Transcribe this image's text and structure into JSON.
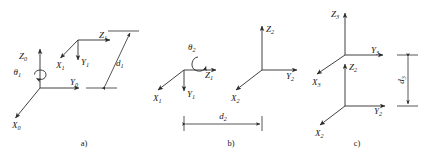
{
  "figure": {
    "background_color": "#ffffff",
    "stroke_color": "#2b2b2b",
    "text_color": "#1a1a1a"
  },
  "panels": [
    {
      "id": "a",
      "caption": "a)",
      "caption_x": 84,
      "caption_y": 146,
      "frames": [
        {
          "name": "frame-0",
          "origin": [
            40,
            88
          ],
          "axes": [
            {
              "axis": "Z",
              "label": "Z",
              "subscript": "0",
              "label_x": 27,
              "label_y": 59,
              "tip": [
                40,
                47
              ],
              "dir": "up"
            },
            {
              "axis": "Y",
              "label": "Y",
              "subscript": "0",
              "label_x": 70,
              "label_y": 85,
              "tip": [
                81,
                88
              ],
              "dir": "right"
            },
            {
              "axis": "X",
              "label": "X",
              "subscript": "0",
              "label_x": 12,
              "label_y": 128,
              "tip": [
                14,
                119
              ],
              "dir": "down-left"
            }
          ],
          "rotation": {
            "label": "θ",
            "subscript": "1",
            "label_x": 21,
            "label_y": 74,
            "about": "Z0"
          }
        },
        {
          "name": "frame-1",
          "origin": [
            78,
            40
          ],
          "axes": [
            {
              "axis": "Z",
              "label": "Z",
              "subscript": "1",
              "label_x": 100,
              "label_y": 38,
              "tip": [
                112,
                40
              ],
              "dir": "right"
            },
            {
              "axis": "Y",
              "label": "Y",
              "subscript": "1",
              "label_x": 82,
              "label_y": 64,
              "tip": [
                78,
                61
              ],
              "dir": "down"
            },
            {
              "axis": "X",
              "label": "X",
              "subscript": "1",
              "label_x": 56,
              "label_y": 67,
              "tip": [
                59,
                59
              ],
              "dir": "down-left"
            }
          ]
        }
      ],
      "dimension": {
        "name": "d1",
        "label": "d",
        "subscript": "1",
        "label_x": 116,
        "label_y": 64,
        "orientation": "slanted",
        "from": [
          104,
          88
        ],
        "to": [
          128,
          40
        ],
        "ext_top": {
          "from": [
            108,
            31
          ],
          "to": [
            138,
            31
          ]
        },
        "ext_bottom": {
          "from": [
            86,
            88
          ],
          "to": [
            116,
            88
          ]
        }
      }
    },
    {
      "id": "b",
      "caption": "b)",
      "caption_x": 231,
      "caption_y": 146,
      "frames": [
        {
          "name": "frame-1",
          "origin": [
            184,
            70
          ],
          "axes": [
            {
              "axis": "Z",
              "label": "Z",
              "subscript": "1",
              "label_x": 206,
              "label_y": 77,
              "tip": [
                218,
                70
              ],
              "dir": "right"
            },
            {
              "axis": "Y",
              "label": "Y",
              "subscript": "1",
              "label_x": 188,
              "label_y": 96,
              "tip": [
                184,
                92
              ],
              "dir": "down"
            },
            {
              "axis": "X",
              "label": "X",
              "subscript": "1",
              "label_x": 154,
              "label_y": 100,
              "tip": [
                157,
                91
              ],
              "dir": "down-left"
            }
          ],
          "rotation": {
            "label": "θ",
            "subscript": "2",
            "label_x": 191,
            "label_y": 49,
            "about": "Z1"
          }
        },
        {
          "name": "frame-2",
          "origin": [
            262,
            70
          ],
          "axes": [
            {
              "axis": "Z",
              "label": "Z",
              "subscript": "2",
              "label_x": 267,
              "label_y": 31,
              "tip": [
                262,
                24
              ],
              "dir": "up"
            },
            {
              "axis": "Y",
              "label": "Y",
              "subscript": "2",
              "label_x": 287,
              "label_y": 78,
              "tip": [
                299,
                70
              ],
              "dir": "right"
            },
            {
              "axis": "X",
              "label": "X",
              "subscript": "2",
              "label_x": 232,
              "label_y": 100,
              "tip": [
                235,
                91
              ],
              "dir": "down-left"
            }
          ]
        }
      ],
      "dimension": {
        "name": "d2",
        "label": "d",
        "subscript": "2",
        "label_x": 218,
        "label_y": 117,
        "orientation": "horizontal",
        "from": [
          184,
          124
        ],
        "to": [
          262,
          124
        ],
        "ext_left": {
          "from": [
            184,
            116
          ],
          "to": [
            184,
            132
          ]
        },
        "ext_right": {
          "from": [
            262,
            116
          ],
          "to": [
            262,
            132
          ]
        }
      }
    },
    {
      "id": "c",
      "caption": "c)",
      "caption_x": 357,
      "caption_y": 146,
      "frames": [
        {
          "name": "frame-2",
          "origin": [
            345,
            106
          ],
          "axes": [
            {
              "axis": "Z",
              "label": "Z",
              "subscript": "2",
              "label_x": 350,
              "label_y": 68,
              "tip": [
                345,
                62
              ],
              "dir": "up"
            },
            {
              "axis": "Y",
              "label": "Y",
              "subscript": "2",
              "label_x": 375,
              "label_y": 113,
              "tip": [
                387,
                106
              ],
              "dir": "right"
            },
            {
              "axis": "X",
              "label": "X",
              "subscript": "2",
              "label_x": 316,
              "label_y": 135,
              "tip": [
                319,
                126
              ],
              "dir": "down-left"
            }
          ]
        },
        {
          "name": "frame-3",
          "origin": [
            345,
            55
          ],
          "axes": [
            {
              "axis": "Z",
              "label": "Z",
              "subscript": "3",
              "label_x": 330,
              "label_y": 16,
              "tip": [
                345,
                11
              ],
              "dir": "up"
            },
            {
              "axis": "Y",
              "label": "Y",
              "subscript": "3",
              "label_x": 372,
              "label_y": 52,
              "tip": [
                385,
                55
              ],
              "dir": "right"
            },
            {
              "axis": "X",
              "label": "X",
              "subscript": "3",
              "label_x": 313,
              "label_y": 84,
              "tip": [
                316,
                75
              ],
              "dir": "down-left"
            }
          ]
        }
      ],
      "dimension": {
        "name": "d3",
        "label": "d",
        "subscript": "3",
        "label_x": 404,
        "label_y": 80,
        "orientation": "vertical",
        "from": [
          408,
          55
        ],
        "to": [
          408,
          106
        ],
        "ext_top": {
          "from": [
            398,
            55
          ],
          "to": [
            418,
            55
          ]
        },
        "ext_bottom": {
          "from": [
            398,
            106
          ],
          "to": [
            418,
            106
          ]
        }
      }
    }
  ]
}
